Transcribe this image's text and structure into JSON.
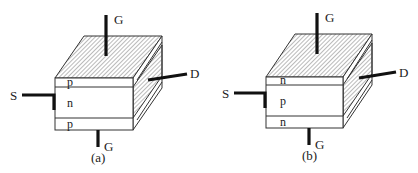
{
  "diagrams": [
    {
      "caption": "(a)",
      "layers": [
        "p",
        "n",
        "p"
      ],
      "terminals": {
        "top_gate": "G",
        "bottom_gate": "G",
        "source": "S",
        "drain": "D"
      },
      "ox": 0
    },
    {
      "caption": "(b)",
      "layers": [
        "n",
        "p",
        "n"
      ],
      "terminals": {
        "top_gate": "G",
        "bottom_gate": "G",
        "source": "S",
        "drain": "D"
      },
      "ox": 211
    }
  ],
  "colors": {
    "stroke": "#333333",
    "lead": "#111111",
    "hatch": "#555555",
    "background": "#ffffff"
  }
}
